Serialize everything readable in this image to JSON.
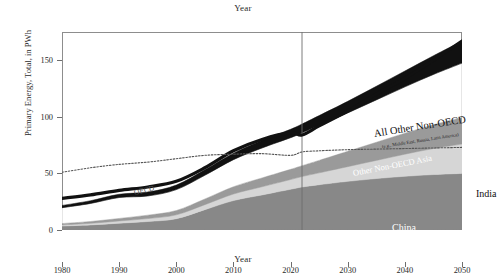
{
  "chart_data": {
    "type": "area",
    "title": "Year",
    "xlabel": "Year",
    "ylabel": "Primary Energy, Total, in PWh",
    "xlim": [
      1980,
      2050
    ],
    "ylim": [
      0,
      175
    ],
    "grid": false,
    "legend_position": "inline-annotations",
    "xticks": [
      "1980",
      "1990",
      "2000",
      "2010",
      "2020",
      "2030",
      "2040",
      "2050"
    ],
    "yticks": [
      "0",
      "50",
      "100",
      "150"
    ],
    "x": [
      1980,
      1985,
      1990,
      1995,
      2000,
      2005,
      2010,
      2015,
      2020,
      2022,
      2025,
      2030,
      2035,
      2040,
      2045,
      2050
    ],
    "series": [
      {
        "name": "China",
        "color": "#888888",
        "stacked": true,
        "values": [
          3.5,
          4.5,
          6.0,
          7.5,
          10.0,
          18.0,
          26.0,
          31.0,
          36.0,
          38.0,
          40.0,
          43.0,
          45.5,
          47.5,
          49.0,
          50.0
        ]
      },
      {
        "name": "India",
        "color": "#d6d6d6",
        "stacked": true,
        "values": [
          1.0,
          1.4,
          2.0,
          2.6,
          3.4,
          4.4,
          5.8,
          7.2,
          8.6,
          9.2,
          10.5,
          13.0,
          16.0,
          19.5,
          23.0,
          26.0
        ]
      },
      {
        "name": "Other Non-OECD Asia",
        "color": "#9a9a9a",
        "stacked": true,
        "values": [
          1.2,
          1.6,
          2.2,
          3.0,
          3.8,
          5.0,
          6.4,
          7.8,
          9.0,
          9.6,
          11.0,
          13.5,
          16.0,
          18.5,
          21.0,
          23.5
        ]
      },
      {
        "name": "All Other Non-OECD",
        "label_sub": "(e.g., Middle East, Russia, Latin America)",
        "color": "#ffffff",
        "stacked": true,
        "values": [
          14.0,
          16.0,
          18.5,
          17.0,
          18.5,
          21.0,
          24.0,
          26.5,
          28.0,
          29.0,
          31.0,
          34.0,
          37.5,
          41.0,
          44.5,
          48.0
        ]
      },
      {
        "name": "Africa",
        "color": "#111111",
        "stacked": true,
        "values": [
          2.0,
          2.4,
          2.9,
          3.4,
          4.0,
          4.8,
          5.6,
          6.6,
          7.4,
          7.8,
          8.6,
          10.2,
          12.0,
          14.0,
          16.5,
          19.5
        ]
      }
    ],
    "lines": [
      {
        "name": "Non-OECD total",
        "style": "solid-thick-black",
        "color": "#111111",
        "values": [
          28.0,
          31.0,
          35.0,
          38.0,
          43.0,
          55.0,
          70.0,
          80.0,
          86.0,
          84.0,
          92.0,
          105.0,
          120.0,
          134.0,
          150.0,
          167.0
        ]
      },
      {
        "name": "OECD",
        "style": "dotted",
        "color": "#555555",
        "values": [
          51.0,
          55.0,
          58.0,
          60.0,
          63.0,
          66.0,
          67.0,
          67.5,
          66.0,
          69.0,
          70.0,
          71.0,
          71.5,
          72.0,
          72.5,
          73.0
        ]
      }
    ],
    "annotations": [
      {
        "name": "Africa",
        "text": "Africa"
      },
      {
        "name": "All Other Non-OECD",
        "text": "All Other Non-OECD"
      },
      {
        "name": "All Other Non-OECD sub",
        "text": "(e.g., Middle East, Russia, Latin America)"
      },
      {
        "name": "Other Non-OECD Asia",
        "text": "Other Non-OECD Asia"
      },
      {
        "name": "India",
        "text": "India"
      },
      {
        "name": "China",
        "text": "China"
      },
      {
        "name": "OECD",
        "text": "OECD"
      }
    ],
    "vertical_divider": {
      "x": 2022,
      "color": "#6e6e6e",
      "label": ""
    }
  }
}
